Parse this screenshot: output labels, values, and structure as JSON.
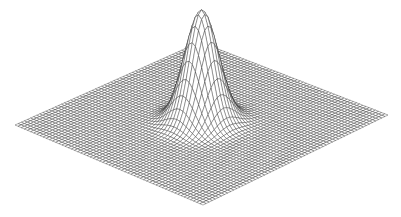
{
  "chart_data": {
    "type": "surface",
    "surface_kind": "wireframe",
    "function": "z = A * exp(-(x^2 + y^2) / (2*sigma^2))",
    "title": "",
    "xlabel": "",
    "ylabel": "",
    "zlabel": "",
    "grid": true,
    "axes_visible": false,
    "legend": null,
    "x_range": [
      -1,
      1
    ],
    "y_range": [
      -1,
      1
    ],
    "grid_lines_per_side": 60,
    "peak": {
      "x": 0,
      "y": 0,
      "amplitude": 1.0,
      "sigma": 0.13
    },
    "projection": {
      "corner_left": [
        15,
        125
      ],
      "corner_right": [
        388,
        115
      ],
      "corner_front": [
        203,
        205
      ],
      "corner_back": [
        200,
        42
      ],
      "peak_pixel_height": 112
    },
    "line_color": "#2b2b2b",
    "background": "#ffffff"
  }
}
